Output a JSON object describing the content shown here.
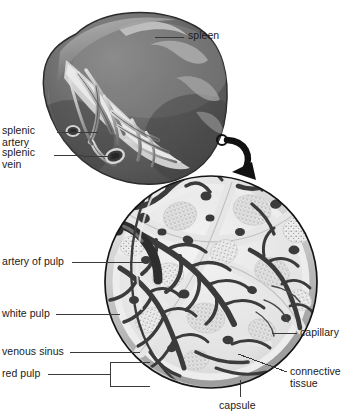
{
  "figure": {
    "background_color": "#ffffff",
    "width": 357,
    "height": 418
  },
  "colors": {
    "organ_dark": "#5e5e5e",
    "organ_mid": "#7a7a7a",
    "organ_light": "#b6b6b6",
    "organ_outline": "#2a2a2a",
    "vessel_light": "#cfcfcf",
    "vessel_dark": "#3a3a3a",
    "pulp_stipple": "#9a9a9a",
    "capsule": "#d8d8d8",
    "leader_line": "#3a3a3a",
    "label_text": "#1a1a1a",
    "arrow": "#111111"
  },
  "labels": [
    {
      "id": "spleen",
      "text": "spleen",
      "x": 188,
      "y": 32,
      "align": "left",
      "leader": {
        "type": "horizontal",
        "x1": 155,
        "y1": 37,
        "x2": 184,
        "y2": 37
      }
    },
    {
      "id": "splenic-artery",
      "text": "splenic\nartery",
      "x": 2,
      "y": 126,
      "align": "left",
      "leader": {
        "type": "horizontal",
        "x1": 57,
        "y1": 132,
        "x2": 98,
        "y2": 132
      }
    },
    {
      "id": "splenic-vein",
      "text": "splenic\nvein",
      "x": 2,
      "y": 148,
      "align": "left",
      "leader": {
        "type": "horizontal",
        "x1": 54,
        "y1": 154,
        "x2": 112,
        "y2": 156
      }
    },
    {
      "id": "artery-of-pulp",
      "text": "artery of pulp",
      "x": 2,
      "y": 256,
      "align": "left",
      "leader": {
        "type": "horizontal",
        "x1": 72,
        "y1": 262,
        "x2": 143,
        "y2": 262
      }
    },
    {
      "id": "white-pulp",
      "text": "white pulp",
      "x": 2,
      "y": 308,
      "align": "left",
      "leader": {
        "type": "horizontal",
        "x1": 56,
        "y1": 314,
        "x2": 120,
        "y2": 314
      }
    },
    {
      "id": "venous-sinus",
      "text": "venous sinus",
      "x": 2,
      "y": 346,
      "align": "left",
      "leader": {
        "type": "horizontal",
        "x1": 70,
        "y1": 352,
        "x2": 140,
        "y2": 352
      }
    },
    {
      "id": "red-pulp",
      "text": "red pulp",
      "x": 2,
      "y": 368,
      "align": "left",
      "leader": {
        "type": "bracket",
        "x1": 48,
        "y1": 374,
        "x2": 110,
        "y2": 374,
        "top": 362,
        "bottom": 386,
        "right": 150
      }
    },
    {
      "id": "capillary",
      "text": "capillary",
      "x": 300,
      "y": 327,
      "align": "left",
      "leader": {
        "type": "horizontal",
        "x1": 272,
        "y1": 333,
        "x2": 297,
        "y2": 333
      }
    },
    {
      "id": "connective-tissue",
      "text": "connective\ntissue",
      "x": 290,
      "y": 367,
      "align": "left",
      "leader": {
        "type": "diagonal",
        "x1": 238,
        "y1": 354,
        "x2": 286,
        "y2": 372
      }
    },
    {
      "id": "capsule",
      "text": "capsule",
      "x": 219,
      "y": 401,
      "align": "left",
      "leader": {
        "type": "vertical",
        "x1": 240,
        "y1": 380,
        "x2": 240,
        "y2": 398
      }
    }
  ],
  "organ": {
    "name": "spleen",
    "shape": "bean",
    "bounds": {
      "x": 38,
      "y": 8,
      "w": 190,
      "h": 176
    },
    "features": [
      "notched superior border",
      "hilum with branching vessels",
      "splenic artery",
      "splenic vein"
    ]
  },
  "magnifier": {
    "name": "splenic-pulp-cross-section",
    "shape": "circle",
    "center_x": 211,
    "center_y": 282,
    "radius": 107,
    "contents": [
      "white pulp nodules",
      "red pulp",
      "venous sinuses",
      "trabeculae",
      "capsule",
      "artery of pulp",
      "capillaries"
    ]
  },
  "callout_arrow": {
    "name": "magnify-arrow",
    "start_x": 222,
    "start_y": 140,
    "end_x": 243,
    "end_y": 178,
    "marker": "small-circle"
  }
}
